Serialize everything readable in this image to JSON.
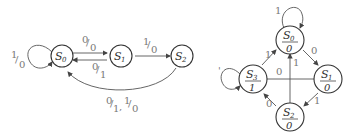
{
  "diagrams": [
    {
      "name": "mealy-machine",
      "states": [
        {
          "id": "S0",
          "label": "S",
          "sub": "0"
        },
        {
          "id": "S1",
          "label": "S",
          "sub": "1"
        },
        {
          "id": "S2",
          "label": "S",
          "sub": "2"
        }
      ],
      "transitions": [
        {
          "from": "S0",
          "to": "S0",
          "label_in": "1",
          "label_out": "0"
        },
        {
          "from": "S0",
          "to": "S1",
          "label_in": "0",
          "label_out": "0"
        },
        {
          "from": "S1",
          "to": "S0",
          "label_in": "0",
          "label_out": "1"
        },
        {
          "from": "S1",
          "to": "S2",
          "label_in": "1",
          "label_out": "0"
        },
        {
          "from": "S2",
          "to": "S0",
          "label": "0/1, 1/0",
          "label_a_in": "0",
          "label_a_out": "1",
          "label_b_in": "1",
          "label_b_out": "0"
        }
      ]
    },
    {
      "name": "moore-machine",
      "states": [
        {
          "id": "S0",
          "label": "S",
          "sub": "0",
          "output": "0"
        },
        {
          "id": "S1",
          "label": "S",
          "sub": "1",
          "output": "0"
        },
        {
          "id": "S2",
          "label": "S",
          "sub": "2",
          "output": "0"
        },
        {
          "id": "S3",
          "label": "S",
          "sub": "3",
          "output": "1"
        }
      ],
      "transitions": [
        {
          "from": "S0",
          "to": "S0",
          "label": "1"
        },
        {
          "from": "S0",
          "to": "S1",
          "label": "0"
        },
        {
          "from": "S1",
          "to": "S3",
          "label": "0"
        },
        {
          "from": "S1",
          "to": "S2",
          "label": "1"
        },
        {
          "from": "S2",
          "to": "S0",
          "label": "1"
        },
        {
          "from": "S2",
          "to": "S3",
          "label": "0"
        },
        {
          "from": "S3",
          "to": "S0",
          "label": "1"
        },
        {
          "from": "S3",
          "to": "S3",
          "label": ""
        }
      ]
    }
  ]
}
